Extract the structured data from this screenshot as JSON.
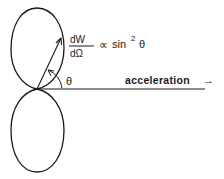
{
  "diagram": {
    "formula": {
      "numerator": "dW",
      "denominator": "dΩ",
      "relation": "∝",
      "function": "sin",
      "exponent": "2",
      "variable": "θ"
    },
    "angle_label": "θ",
    "axis_label": "acceleration",
    "axis_arrow": "→",
    "colors": {
      "ink": "#1a1a1a",
      "background": "#ffffff"
    }
  }
}
